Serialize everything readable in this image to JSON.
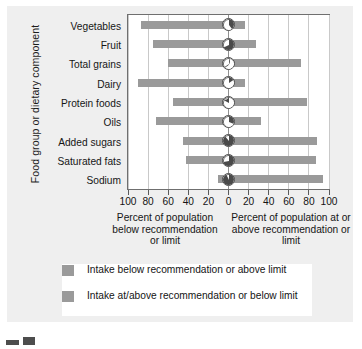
{
  "chart_data": {
    "type": "bar",
    "subtype": "diverging-horizontal",
    "title": "",
    "xlabel_left": "Percent of population below recommendation or limit",
    "xlabel_right": "Percent of population at or above recommendation or limit",
    "ylabel": "Food group or dietary component",
    "categories": [
      "Vegetables",
      "Fruit",
      "Total grains",
      "Dairy",
      "Protein foods",
      "Oils",
      "Added sugars",
      "Saturated fats",
      "Sodium"
    ],
    "series": [
      {
        "name": "Intake below recommendation or above limit",
        "values": [
          87,
          75,
          60,
          90,
          55,
          72,
          45,
          42,
          10
        ]
      },
      {
        "name": "Intake at/above recommendation or below limit",
        "values": [
          13,
          25,
          40,
          10,
          45,
          28,
          55,
          58,
          90
        ]
      }
    ],
    "bar_extents_percent": [
      {
        "category": "Vegetables",
        "left": 87,
        "right": 16
      },
      {
        "category": "Fruit",
        "left": 75,
        "right": 27
      },
      {
        "category": "Total grains",
        "left": 60,
        "right": 72
      },
      {
        "category": "Dairy",
        "left": 90,
        "right": 16
      },
      {
        "category": "Protein foods",
        "left": 55,
        "right": 78
      },
      {
        "category": "Oils",
        "left": 72,
        "right": 32
      },
      {
        "category": "Added sugars",
        "left": 45,
        "right": 88
      },
      {
        "category": "Saturated fats",
        "left": 42,
        "right": 87
      },
      {
        "category": "Sodium",
        "left": 10,
        "right": 94
      }
    ],
    "xticks_left": [
      "100",
      "80",
      "60",
      "40",
      "20"
    ],
    "xtick_center": "0",
    "xticks_right": [
      "20",
      "40",
      "60",
      "80",
      "100"
    ],
    "xlim": [
      -100,
      100
    ],
    "xtick_step": 20,
    "grid": true,
    "legend_position": "bottom",
    "colors": {
      "bar": "#9a9a9a",
      "grid": "#c9c9c9",
      "axis": "#6f6f6f",
      "panel": "#efefef",
      "plot_background": "#ffffff",
      "text": "#141414"
    }
  },
  "xaxis": {
    "labels_left": [
      "100",
      "80",
      "60",
      "40",
      "20"
    ],
    "label_center": "0",
    "labels_right": [
      "20",
      "40",
      "60",
      "80",
      "100"
    ],
    "caption_left": "Percent of population below recommendation or limit",
    "caption_right": "Percent of population at or above recommendation or limit"
  },
  "yaxis": {
    "title": "Food group or dietary component",
    "categories": [
      "Vegetables",
      "Fruit",
      "Total grains",
      "Dairy",
      "Protein foods",
      "Oils",
      "Added sugars",
      "Saturated fats",
      "Sodium"
    ]
  },
  "legend": {
    "items": [
      {
        "label": "Intake below recommendation or above limit",
        "color": "#9a9a9a"
      },
      {
        "label": "Intake at/above recommendation or below limit",
        "color": "#9a9a9a"
      }
    ]
  }
}
